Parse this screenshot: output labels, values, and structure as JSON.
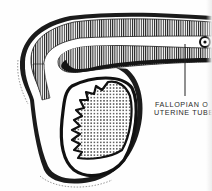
{
  "figure": {
    "colors": {
      "ink": "#111111",
      "background": "#fefefe",
      "label": "#2a2a2a"
    },
    "labels": [
      {
        "line1": "FALLOPIAN O",
        "line2": "UTERINE TUBE"
      }
    ],
    "parts": [
      "outer-wall",
      "striated-muscular-layer",
      "lumen",
      "tube-cross-section-marker",
      "ovary",
      "fimbriae-folds",
      "stippled-tissue",
      "leader-line"
    ]
  }
}
